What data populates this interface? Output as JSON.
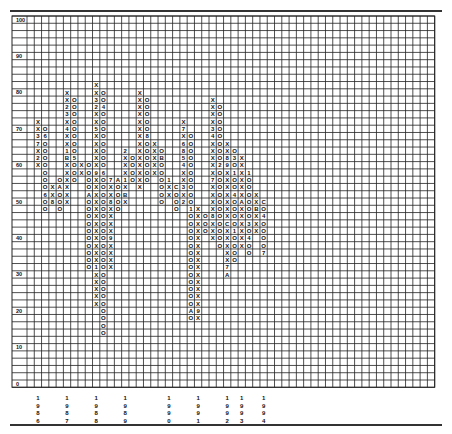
{
  "chart_data": {
    "type": "point-and-figure",
    "title": "",
    "xlabel": "",
    "ylabel": "",
    "box_size": 2,
    "ylim": [
      0,
      100
    ],
    "y_tick_labels": [
      "100",
      "90",
      "80",
      "70",
      "60",
      "50",
      "40",
      "30",
      "20",
      "10",
      "0"
    ],
    "grid": true,
    "years": [
      {
        "label": "1986",
        "col": 1
      },
      {
        "label": "1987",
        "col": 5
      },
      {
        "label": "1988",
        "col": 9
      },
      {
        "label": "1989",
        "col": 13
      },
      {
        "label": "1990",
        "col": 19
      },
      {
        "label": "1991",
        "col": 23
      },
      {
        "label": "1992",
        "col": 27
      },
      {
        "label": "1993",
        "col": 29
      },
      {
        "label": "1994",
        "col": 32
      }
    ],
    "columns": [
      {
        "col": 1,
        "type": "X",
        "low": 60,
        "high": 72,
        "marks": {
          "68": "3",
          "66": "7",
          "62": "2"
        }
      },
      {
        "col": 2,
        "type": "O",
        "low": 48,
        "high": 70,
        "marks": {
          "68": "6",
          "52": "6"
        }
      },
      {
        "col": 3,
        "type": "X",
        "low": 50,
        "high": 54,
        "marks": {
          "50": "8"
        }
      },
      {
        "col": 4,
        "type": "O",
        "low": 48,
        "high": 56,
        "marks": {
          "54": "A"
        }
      },
      {
        "col": 5,
        "type": "X",
        "low": 50,
        "high": 80,
        "marks": {
          "76": "2",
          "74": "3",
          "70": "4",
          "64": "1",
          "62": "B"
        }
      },
      {
        "col": 6,
        "type": "O",
        "low": 56,
        "high": 78,
        "marks": {
          "62": "5"
        }
      },
      {
        "col": 7,
        "type": "X",
        "low": 58,
        "high": 60
      },
      {
        "col": 8,
        "type": "O",
        "low": 32,
        "high": 60,
        "marks": {
          "52": "A"
        }
      },
      {
        "col": 9,
        "type": "X",
        "low": 22,
        "high": 82,
        "marks": {
          "78": "3",
          "76": "2",
          "70": "5",
          "58": "9",
          "32": "1",
          "20": "B"
        }
      },
      {
        "col": 10,
        "type": "O",
        "low": 14,
        "high": 80,
        "marks": {
          "76": "4",
          "58": "6"
        }
      },
      {
        "col": 11,
        "type": "X",
        "low": 32,
        "high": 56,
        "marks": {
          "56": "7",
          "50": "8",
          "40": "9"
        }
      },
      {
        "col": 12,
        "type": "O",
        "low": 48,
        "high": 56,
        "marks": {
          "56": "A"
        }
      },
      {
        "col": 13,
        "type": "X",
        "low": 50,
        "high": 64,
        "marks": {
          "64": "2",
          "56": "1",
          "52": "B"
        }
      },
      {
        "col": 14,
        "type": "O",
        "low": 56,
        "high": 62
      },
      {
        "col": 15,
        "type": "X",
        "low": 54,
        "high": 80
      },
      {
        "col": 16,
        "type": "O",
        "low": 56,
        "high": 78,
        "marks": {
          "68": "8"
        }
      },
      {
        "col": 17,
        "type": "X",
        "low": 58,
        "high": 66
      },
      {
        "col": 18,
        "type": "O",
        "low": 50,
        "high": 64,
        "marks": {
          "62": "B"
        }
      },
      {
        "col": 19,
        "type": "X",
        "low": 52,
        "high": 56,
        "marks": {
          "56": "1"
        }
      },
      {
        "col": 20,
        "type": "O",
        "low": 48,
        "high": 54,
        "marks": {
          "54": "C"
        }
      },
      {
        "col": 21,
        "type": "X",
        "low": 50,
        "high": 72,
        "marks": {
          "70": "7",
          "66": "6",
          "64": "8",
          "62": "5",
          "60": "4",
          "54": "3",
          "50": "2"
        }
      },
      {
        "col": 22,
        "type": "O",
        "low": 18,
        "high": 68,
        "marks": {
          "48": "1",
          "20": "A"
        }
      },
      {
        "col": 23,
        "type": "X",
        "low": 18,
        "high": 48,
        "marks": {
          "20": "9"
        }
      },
      {
        "col": 24,
        "type": "O",
        "low": 42,
        "high": 46
      },
      {
        "col": 25,
        "type": "X",
        "low": 40,
        "high": 78,
        "marks": {
          "70": "3",
          "68": "4",
          "56": "7",
          "46": "8"
        }
      },
      {
        "col": 26,
        "type": "O",
        "low": 38,
        "high": 76,
        "marks": {
          "60": "2"
        }
      },
      {
        "col": 27,
        "type": "X",
        "low": 30,
        "high": 66,
        "marks": {
          "62": "8",
          "60": "9",
          "44": "C",
          "32": "7",
          "30": "A"
        }
      },
      {
        "col": 28,
        "type": "O",
        "low": 34,
        "high": 64,
        "marks": {
          "62": "3",
          "58": "1",
          "52": "4",
          "42": "1"
        }
      },
      {
        "col": 29,
        "type": "X",
        "low": 38,
        "high": 62,
        "marks": {
          "50": "A"
        }
      },
      {
        "col": 30,
        "type": "O",
        "low": 36,
        "high": 58,
        "marks": {
          "58": "1",
          "44": "3",
          "40": "4"
        }
      },
      {
        "col": 31,
        "type": "X",
        "low": 42,
        "high": 52,
        "marks": {
          "48": "B"
        }
      },
      {
        "col": 32,
        "type": "O",
        "low": 36,
        "high": 50,
        "marks": {
          "50": "C",
          "46": "4",
          "36": "7"
        }
      }
    ]
  },
  "layout": {
    "grid_left": 27,
    "grid_top": 16,
    "cell": 7.28,
    "cols": 56,
    "rows": 51,
    "axis_left": 12,
    "line_color": "#222222",
    "ink_color": "#111111"
  }
}
